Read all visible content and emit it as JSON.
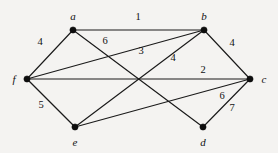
{
  "figure": {
    "background_color": "#f4f3f1",
    "ink_color": "#1a1a1a",
    "width": 278,
    "height": 153
  },
  "chart_data": {
    "type": "diagram",
    "diagram_type": "weighted-undirected-graph",
    "title": "",
    "nodes": [
      {
        "id": "a",
        "label": "a",
        "x": 73,
        "y": 30,
        "label_x": 73,
        "label_y": 16
      },
      {
        "id": "b",
        "label": "b",
        "x": 204,
        "y": 30,
        "label_x": 204,
        "label_y": 16
      },
      {
        "id": "c",
        "label": "c",
        "x": 250,
        "y": 79,
        "label_x": 264,
        "label_y": 79
      },
      {
        "id": "d",
        "label": "d",
        "x": 203,
        "y": 127,
        "label_x": 203,
        "label_y": 142
      },
      {
        "id": "e",
        "label": "e",
        "x": 75,
        "y": 127,
        "label_x": 75,
        "label_y": 142
      },
      {
        "id": "f",
        "label": "f",
        "x": 27,
        "y": 79,
        "label_x": 14,
        "label_y": 79
      }
    ],
    "edges": [
      {
        "source": "a",
        "target": "b",
        "weight": 1,
        "label_x": 138,
        "label_y": 17
      },
      {
        "source": "f",
        "target": "a",
        "weight": 4,
        "label_x": 40,
        "label_y": 42
      },
      {
        "source": "a",
        "target": "d",
        "weight": 6,
        "label_x": 105,
        "label_y": 41
      },
      {
        "source": "f",
        "target": "b",
        "weight": 3,
        "label_x": 141,
        "label_y": 51
      },
      {
        "source": "b",
        "target": "e",
        "weight": 4,
        "label_x": 173,
        "label_y": 58
      },
      {
        "source": "b",
        "target": "c",
        "weight": 4,
        "label_x": 232,
        "label_y": 43
      },
      {
        "source": "f",
        "target": "c",
        "weight": 2,
        "label_x": 203,
        "label_y": 70
      },
      {
        "source": "f",
        "target": "e",
        "weight": 5,
        "label_x": 41,
        "label_y": 105
      },
      {
        "source": "e",
        "target": "c",
        "weight": 6,
        "label_x": 222,
        "label_y": 96
      },
      {
        "source": "c",
        "target": "d",
        "weight": 7,
        "label_x": 232,
        "label_y": 108
      }
    ]
  }
}
